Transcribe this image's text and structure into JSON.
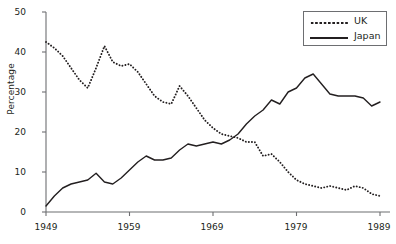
{
  "chart_data": {
    "type": "line",
    "title": "",
    "subtitle": "",
    "xlabel": "",
    "ylabel": "Percentage",
    "xlim": [
      1949,
      1989
    ],
    "ylim": [
      0,
      50
    ],
    "grid": false,
    "legend_position": "top-right",
    "x_ticks": [
      "1949",
      "1959",
      "1969",
      "1979",
      "1989"
    ],
    "y_ticks": [
      "0",
      "10",
      "20",
      "30",
      "40",
      "50"
    ],
    "x": [
      1949,
      1950,
      1951,
      1952,
      1953,
      1954,
      1955,
      1956,
      1957,
      1958,
      1959,
      1960,
      1961,
      1962,
      1963,
      1964,
      1965,
      1966,
      1967,
      1968,
      1969,
      1970,
      1971,
      1972,
      1973,
      1974,
      1975,
      1976,
      1977,
      1978,
      1979,
      1980,
      1981,
      1982,
      1983,
      1984,
      1985,
      1986,
      1987,
      1988,
      1989
    ],
    "series": [
      {
        "name": "UK",
        "style": "dotted",
        "color": "#231f20",
        "values": [
          42.5,
          41.0,
          39.0,
          36.0,
          33.0,
          31.0,
          36.0,
          41.5,
          37.5,
          36.5,
          37.0,
          35.0,
          32.0,
          29.0,
          27.5,
          27.0,
          31.5,
          29.0,
          26.0,
          23.0,
          21.0,
          19.5,
          19.0,
          18.5,
          17.5,
          17.5,
          14.0,
          14.5,
          12.5,
          10.0,
          8.0,
          7.0,
          6.5,
          6.0,
          6.5,
          6.0,
          5.5,
          6.5,
          6.0,
          4.5,
          4.0
        ]
      },
      {
        "name": "Japan",
        "style": "solid",
        "color": "#231f20",
        "values": [
          1.5,
          4.0,
          6.0,
          7.0,
          7.5,
          8.0,
          9.7,
          7.5,
          7.0,
          8.5,
          10.5,
          12.5,
          14.0,
          13.0,
          13.0,
          13.5,
          15.5,
          17.0,
          16.5,
          17.0,
          17.5,
          17.0,
          18.0,
          19.5,
          22.0,
          24.0,
          25.5,
          28.0,
          27.0,
          30.0,
          31.0,
          33.5,
          34.5,
          32.0,
          29.5,
          29.0,
          29.0,
          29.0,
          28.5,
          26.5,
          27.5
        ]
      }
    ]
  },
  "legend": {
    "entries": [
      {
        "label": "UK",
        "style": "dotted"
      },
      {
        "label": "Japan",
        "style": "solid"
      }
    ]
  }
}
